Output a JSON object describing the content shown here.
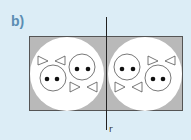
{
  "figure": {
    "part_label": "b)",
    "mirror_line_label": "r",
    "background_color": "#dcedf6",
    "rectangle_fill": "#b9b9b9",
    "circle_fill": "#ffffff",
    "label_color": "#5b8db3"
  },
  "shapes": {
    "left_half": [
      "bowtie-top-left",
      "face-bottom-left",
      "face-top-right",
      "bowtie-bottom-right"
    ],
    "right_half": [
      "face-top-left",
      "bowtie-bottom-left",
      "bowtie-top-right",
      "face-bottom-right"
    ]
  }
}
